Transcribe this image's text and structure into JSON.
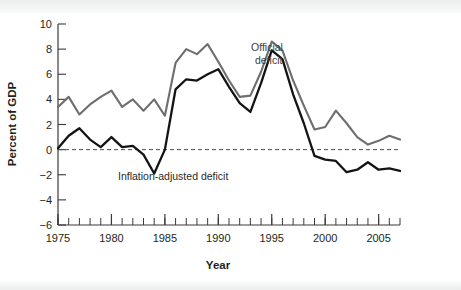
{
  "chart_data": {
    "type": "line",
    "title": "",
    "xlabel": "Year",
    "ylabel": "Percent of GDP",
    "xlim": [
      1975,
      2007
    ],
    "ylim": [
      -6,
      10
    ],
    "ytick_values": [
      10,
      8,
      6,
      4,
      2,
      0,
      -2,
      -4,
      -6
    ],
    "ytick_labels": [
      "10",
      "8",
      "6",
      "4",
      "2",
      "0",
      "−2",
      "−4",
      "−6"
    ],
    "xtick_values": [
      1975,
      1980,
      1985,
      1990,
      1995,
      2000,
      2005
    ],
    "xtick_labels": [
      "1975",
      "1980",
      "1985",
      "1990",
      "1995",
      "2000",
      "2005"
    ],
    "x_minor_tick_step": 1,
    "grid": false,
    "legend_position": "inline-annotation",
    "zero_reference_line": {
      "value": 0,
      "style": "dashed",
      "color": "#4d4d4d"
    },
    "x": [
      1975,
      1976,
      1977,
      1978,
      1979,
      1980,
      1981,
      1982,
      1983,
      1984,
      1985,
      1986,
      1987,
      1988,
      1989,
      1990,
      1991,
      1992,
      1993,
      1994,
      1995,
      1996,
      1997,
      1998,
      1999,
      2000,
      2001,
      2002,
      2003,
      2004,
      2005,
      2006,
      2007
    ],
    "series": [
      {
        "name": "Official deficit",
        "color": "#6e6e6e",
        "label_text": "Official\ndeficit",
        "label_line1": "Official",
        "label_line2": "deficit",
        "values": [
          3.4,
          4.2,
          2.8,
          3.6,
          4.2,
          4.7,
          3.4,
          4.0,
          3.1,
          4.0,
          2.7,
          6.9,
          8.0,
          7.6,
          8.4,
          7.0,
          5.5,
          4.2,
          4.3,
          6.2,
          8.6,
          7.9,
          5.5,
          3.5,
          1.6,
          1.8,
          3.1,
          2.1,
          1.0,
          0.4,
          0.7,
          1.1,
          0.8
        ],
        "annotation_x": 1994,
        "annotation_y": 7.4
      },
      {
        "name": "Inflation-adjusted deficit",
        "color": "#141414",
        "label_text": "Inflation-adjusted deficit",
        "values": [
          0.1,
          1.1,
          1.7,
          0.8,
          0.2,
          1.0,
          0.2,
          0.3,
          -0.4,
          -1.9,
          0.0,
          4.8,
          5.6,
          5.5,
          6.0,
          6.4,
          5.0,
          3.7,
          3.0,
          5.3,
          7.9,
          7.2,
          4.4,
          2.1,
          -0.5,
          -0.8,
          -0.9,
          -1.8,
          -1.6,
          -1.0,
          -1.6,
          -1.5,
          -1.7
        ],
        "annotation_x": 1981.3,
        "annotation_y": -1.6
      }
    ],
    "annotations": [
      {
        "name": "official-deficit-label",
        "text_line1": "Official",
        "text_line2": "deficit"
      },
      {
        "name": "inflation-adjusted-deficit-label",
        "text": "Inflation-adjusted deficit"
      }
    ]
  },
  "axes": {
    "ylabel": "Percent of GDP",
    "xlabel": "Year"
  }
}
